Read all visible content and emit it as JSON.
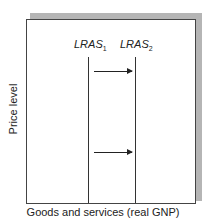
{
  "diagram": {
    "curves": [
      {
        "name": "LRAS",
        "subscript": "1"
      },
      {
        "name": "LRAS",
        "subscript": "2"
      }
    ],
    "y_axis_label": "Price level",
    "x_axis_label": "Goods and services (real GNP)",
    "arrows": [
      {
        "direction": "right",
        "meaning": "shift from LRAS1 to LRAS2"
      },
      {
        "direction": "right",
        "meaning": "shift from LRAS1 to LRAS2"
      }
    ]
  }
}
